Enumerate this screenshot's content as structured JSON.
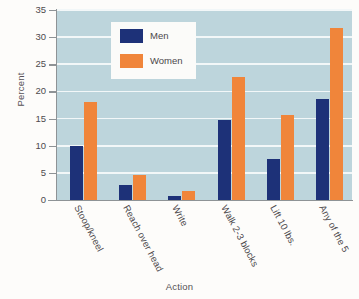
{
  "chart_data": {
    "type": "bar",
    "title": "",
    "xlabel": "Action",
    "ylabel": "Percent",
    "ylim": [
      0,
      35
    ],
    "yticks": [
      0,
      5,
      10,
      15,
      20,
      25,
      30,
      35
    ],
    "ytick_labels": [
      "0",
      "5",
      "10",
      "15",
      "20",
      "25",
      "30",
      "35"
    ],
    "grid": true,
    "legend_position": "upper-left-inside",
    "categories": [
      "Stoop/kneel",
      "Reach over head",
      "Write",
      "Walk 2-3 blocks",
      "Lift 10 lbs.",
      "Any of the 5"
    ],
    "series": [
      {
        "name": "Men",
        "color": "#1d3178",
        "values": [
          10.0,
          2.8,
          0.7,
          14.8,
          7.6,
          18.7
        ]
      },
      {
        "name": "Women",
        "color": "#f0853a",
        "values": [
          18.0,
          4.7,
          1.7,
          22.7,
          15.6,
          31.6
        ]
      }
    ],
    "plot_background_color": "#bdd5dc",
    "gridline_color": "#f2f7f8",
    "page_background_color": "#fdfcfa"
  }
}
